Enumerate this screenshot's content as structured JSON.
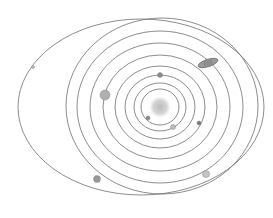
{
  "diagram": {
    "type": "solar-system-orbits",
    "background": "#ffffff",
    "orbit_color": "#6e6e6e",
    "sun": {
      "name": "sun",
      "cx": 160,
      "cy": 107,
      "r": 9,
      "color": "#c8c8c8"
    },
    "orbits": [
      {
        "name": "orbit-1",
        "cx": 160,
        "cy": 107,
        "rx": 19,
        "ry": 18
      },
      {
        "name": "orbit-2",
        "cx": 160,
        "cy": 107,
        "rx": 26,
        "ry": 24
      },
      {
        "name": "orbit-3",
        "cx": 160,
        "cy": 107,
        "rx": 35,
        "ry": 32
      },
      {
        "name": "orbit-4",
        "cx": 160,
        "cy": 107,
        "rx": 45,
        "ry": 41
      },
      {
        "name": "orbit-5",
        "cx": 160,
        "cy": 107,
        "rx": 57,
        "ry": 52
      },
      {
        "name": "orbit-6",
        "cx": 160,
        "cy": 107,
        "rx": 70,
        "ry": 64
      },
      {
        "name": "orbit-7",
        "cx": 160,
        "cy": 107,
        "rx": 83,
        "ry": 76
      },
      {
        "name": "orbit-8",
        "cx": 162,
        "cy": 106,
        "rx": 96,
        "ry": 88
      },
      {
        "name": "orbit-9",
        "cx": 141,
        "cy": 107,
        "rx": 123,
        "ry": 88
      }
    ],
    "planets": [
      {
        "name": "mercury",
        "cx": 148,
        "cy": 118,
        "r": 2,
        "color": "#8a8a8a"
      },
      {
        "name": "venus",
        "cx": 173,
        "cy": 127,
        "r": 2.5,
        "color": "#bdbdbd"
      },
      {
        "name": "earth",
        "cx": 199,
        "cy": 123,
        "r": 2,
        "color": "#7a7a7a"
      },
      {
        "name": "mars",
        "cx": 160,
        "cy": 75,
        "r": 2.5,
        "color": "#8c8c8c"
      },
      {
        "name": "jupiter",
        "cx": 105,
        "cy": 95,
        "r": 5,
        "color": "#b0b0b0"
      },
      {
        "name": "saturn",
        "cx": 208,
        "cy": 63,
        "r": 4,
        "color": "#8f8f8f",
        "ring": true
      },
      {
        "name": "uranus",
        "cx": 97,
        "cy": 179,
        "r": 3.5,
        "color": "#9a9a9a"
      },
      {
        "name": "neptune",
        "cx": 206,
        "cy": 174,
        "r": 3.5,
        "color": "#c4c4c4"
      },
      {
        "name": "pluto",
        "cx": 33,
        "cy": 67,
        "r": 1.5,
        "color": "#bcbcbc"
      }
    ]
  }
}
